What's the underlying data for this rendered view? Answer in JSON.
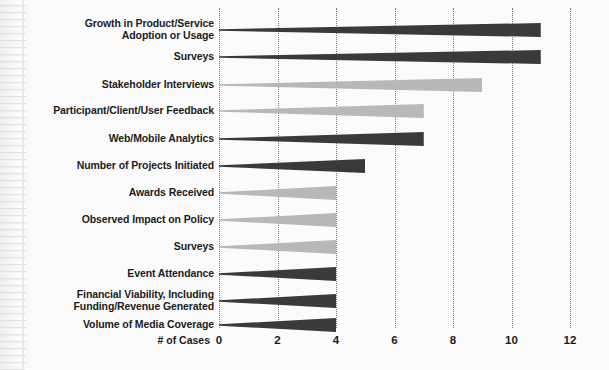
{
  "chart_data": {
    "type": "bar",
    "orientation": "horizontal",
    "title": "",
    "xlabel": "# of Cases",
    "ylabel": "",
    "xlim": [
      0,
      12
    ],
    "xticks": [
      0,
      2,
      4,
      6,
      8,
      10,
      12
    ],
    "xtick_labels": [
      "0",
      "2",
      "4",
      "6",
      "8",
      "10",
      "12"
    ],
    "grid": true,
    "grid_style": "dotted-vertical",
    "legend": "none",
    "categories": [
      "Growth in Product/Service Adoption or Usage",
      "Surveys",
      "Stakeholder Interviews",
      "Participant/Client/User Feedback",
      "Web/Mobile Analytics",
      "Number of Projects Initiated",
      "Awards Received",
      "Observed Impact on Policy",
      "Surveys",
      "Event Attendance",
      "Financial Viability, Including Funding/Revenue Generated",
      "Volume of Media Coverage"
    ],
    "category_lines": [
      [
        "Growth in Product/Service",
        "Adoption or Usage"
      ],
      [
        "Surveys"
      ],
      [
        "Stakeholder Interviews"
      ],
      [
        "Participant/Client/User Feedback"
      ],
      [
        "Web/Mobile Analytics"
      ],
      [
        "Number of Projects Initiated"
      ],
      [
        "Awards Received"
      ],
      [
        "Observed Impact on Policy"
      ],
      [
        "Surveys"
      ],
      [
        "Event Attendance"
      ],
      [
        "Financial Viability, Including",
        "Funding/Revenue Generated"
      ],
      [
        "Volume of Media Coverage"
      ]
    ],
    "values": [
      11,
      11,
      9,
      7,
      7,
      5,
      4,
      4,
      4,
      4,
      4,
      4
    ],
    "bar_colors": [
      "#3a3a3a",
      "#3a3a3a",
      "#b8b8b8",
      "#b8b8b8",
      "#3a3a3a",
      "#3a3a3a",
      "#b8b8b8",
      "#b8b8b8",
      "#b8b8b8",
      "#3a3a3a",
      "#3a3a3a",
      "#3a3a3a"
    ]
  },
  "colors": {
    "dark_series": "#3a3a3a",
    "light_series": "#b8b8b8",
    "gridline": "#7b7b7b",
    "text": "#1b1b1b",
    "background": "#fbfbfb"
  }
}
